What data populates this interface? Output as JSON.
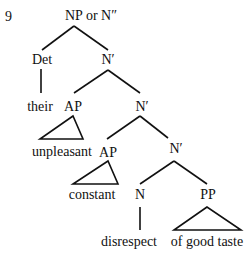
{
  "example_number": "9",
  "diagram_type": "syntax tree",
  "colors": {
    "ink": "#111111",
    "background": "#ffffff"
  },
  "nodes": [
    {
      "id": "root",
      "label": "NP or N″",
      "x": 91,
      "y": 20
    },
    {
      "id": "det",
      "label": "Det",
      "x": 42,
      "y": 64
    },
    {
      "id": "nbar1",
      "label": "N′",
      "x": 108,
      "y": 64
    },
    {
      "id": "their",
      "label": "their",
      "x": 40,
      "y": 111
    },
    {
      "id": "ap1",
      "label": "AP",
      "x": 73,
      "y": 111
    },
    {
      "id": "nbar2",
      "label": "N′",
      "x": 142,
      "y": 111
    },
    {
      "id": "unpleasant",
      "label": "unpleasant",
      "x": 62,
      "y": 156
    },
    {
      "id": "ap2",
      "label": "AP",
      "x": 108,
      "y": 157
    },
    {
      "id": "nbar3",
      "label": "N′",
      "x": 176,
      "y": 153
    },
    {
      "id": "constant",
      "label": "constant",
      "x": 92,
      "y": 199
    },
    {
      "id": "n",
      "label": "N",
      "x": 140,
      "y": 199
    },
    {
      "id": "pp",
      "label": "PP",
      "x": 208,
      "y": 199
    },
    {
      "id": "disrespect",
      "label": "disrespect",
      "x": 129,
      "y": 246
    },
    {
      "id": "ofgoodtaste",
      "label": "of good taste",
      "x": 207,
      "y": 246
    }
  ],
  "edges": [
    {
      "from": "root",
      "to": "det",
      "x1": 74,
      "y1": 26,
      "x2": 42,
      "y2": 50
    },
    {
      "from": "root",
      "to": "nbar1",
      "x1": 74,
      "y1": 26,
      "x2": 108,
      "y2": 50
    },
    {
      "from": "det",
      "to": "their",
      "x1": 41,
      "y1": 69,
      "x2": 41,
      "y2": 93
    },
    {
      "from": "nbar1",
      "to": "ap1",
      "x1": 108,
      "y1": 70,
      "x2": 74,
      "y2": 93
    },
    {
      "from": "nbar1",
      "to": "nbar2",
      "x1": 108,
      "y1": 70,
      "x2": 140,
      "y2": 93
    },
    {
      "from": "nbar2",
      "to": "ap2",
      "x1": 140,
      "y1": 116,
      "x2": 107,
      "y2": 139
    },
    {
      "from": "nbar2",
      "to": "nbar3",
      "x1": 140,
      "y1": 116,
      "x2": 168,
      "y2": 138
    },
    {
      "from": "nbar3",
      "to": "n",
      "x1": 174,
      "y1": 161,
      "x2": 140,
      "y2": 184
    },
    {
      "from": "nbar3",
      "to": "pp",
      "x1": 174,
      "y1": 161,
      "x2": 207,
      "y2": 184
    },
    {
      "from": "n",
      "to": "disrespect",
      "x1": 140,
      "y1": 207,
      "x2": 140,
      "y2": 230
    }
  ],
  "triangles": [
    {
      "under": "ap1",
      "covers": "unpleasant",
      "points": "73,116 40,139 83,139"
    },
    {
      "under": "ap2",
      "covers": "constant",
      "points": "108,161 73,184 118,184"
    },
    {
      "under": "pp",
      "covers": "of good taste",
      "points": "207,207 174,230 241,230"
    }
  ]
}
